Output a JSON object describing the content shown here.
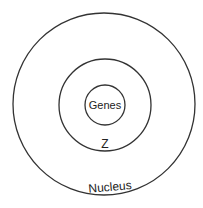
{
  "diagram": {
    "type": "nested-circles",
    "stroke_color": "#333333",
    "background": "#ffffff",
    "circles": [
      {
        "name": "outer",
        "label": "Nucleus",
        "cx": 104,
        "cy": 104,
        "r": 91
      },
      {
        "name": "middle",
        "label": "Z",
        "cx": 105,
        "cy": 105,
        "r": 46
      },
      {
        "name": "inner",
        "label": "Genes",
        "cx": 105,
        "cy": 105,
        "r": 20
      }
    ],
    "labels": {
      "outer": "Nucleus",
      "middle": "Z",
      "inner": "Genes"
    }
  }
}
